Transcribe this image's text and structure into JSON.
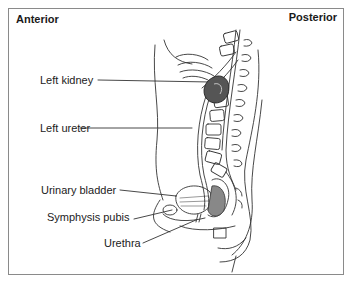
{
  "diagram": {
    "type": "anatomical-sagittal-section",
    "orientation": {
      "left": "Anterior",
      "right": "Posterior"
    },
    "labels": [
      {
        "id": "left-kidney",
        "text": "Left kidney"
      },
      {
        "id": "left-ureter",
        "text": "Left ureter"
      },
      {
        "id": "urinary-bladder",
        "text": "Urinary bladder"
      },
      {
        "id": "symphysis-pubis",
        "text": "Symphysis pubis"
      },
      {
        "id": "urethra",
        "text": "Urethra"
      }
    ],
    "colors": {
      "line": "#333333",
      "kidney_fill": "#555555",
      "frame": "#8a8a8a"
    }
  }
}
